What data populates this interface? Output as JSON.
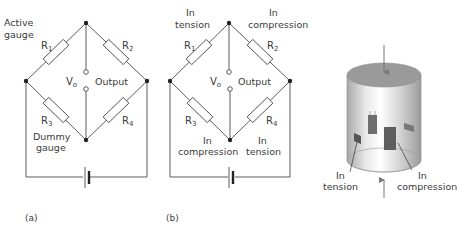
{
  "figure": {
    "panel_a": {
      "caption": "(a)",
      "labels": {
        "active_line1": "Active",
        "active_line2": "gauge",
        "dummy_line1": "Dummy",
        "dummy_line2": "gauge",
        "vo": "V",
        "vo_sub": "o",
        "output": "Output"
      },
      "resistors": [
        {
          "name": "R",
          "sub": "1"
        },
        {
          "name": "R",
          "sub": "2"
        },
        {
          "name": "R",
          "sub": "3"
        },
        {
          "name": "R",
          "sub": "4"
        }
      ]
    },
    "panel_b": {
      "caption": "(b)",
      "labels": {
        "r1_state_1": "In",
        "r1_state_2": "tension",
        "r2_state_1": "In",
        "r2_state_2": "compression",
        "r3_state_1": "In",
        "r3_state_2": "compression",
        "r4_state_1": "In",
        "r4_state_2": "tension",
        "vo": "V",
        "vo_sub": "o",
        "output": "Output"
      },
      "resistors": [
        {
          "name": "R",
          "sub": "1"
        },
        {
          "name": "R",
          "sub": "2"
        },
        {
          "name": "R",
          "sub": "3"
        },
        {
          "name": "R",
          "sub": "4"
        }
      ]
    },
    "panel_c": {
      "labels": {
        "tension_1": "In",
        "tension_2": "tension",
        "compression_1": "In",
        "compression_2": "compression"
      }
    },
    "colors": {
      "line": "#4a4a4a",
      "cylinder_top": "#9a9a9a",
      "gauge": "#6e6e6e",
      "text": "#3a3a3a"
    }
  }
}
